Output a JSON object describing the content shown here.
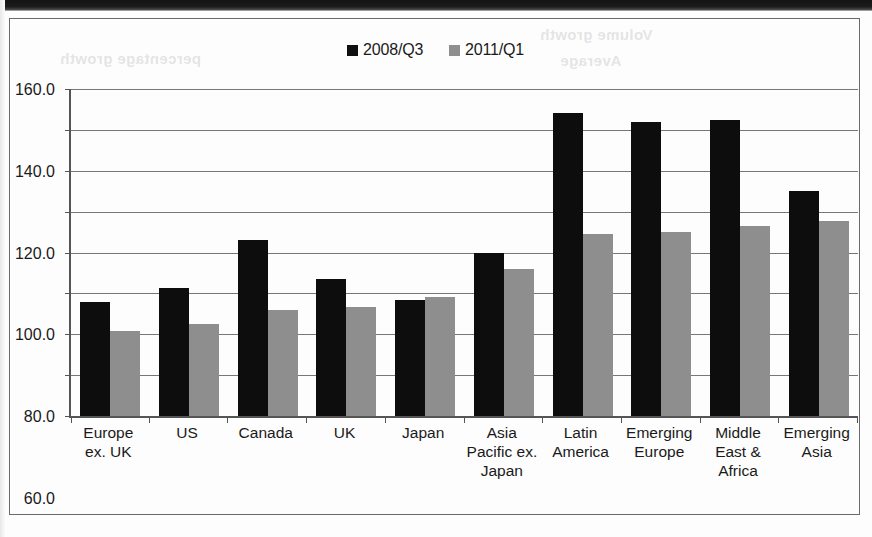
{
  "legend": {
    "entries": [
      {
        "label": "2008/Q3",
        "color": "#0d0d0d",
        "swatch": "black-square-icon"
      },
      {
        "label": "2011/Q1",
        "color": "#8e8e8e",
        "swatch": "gray-square-icon"
      }
    ]
  },
  "axis": {
    "y_ticks": [
      "160.0",
      "140.0",
      "120.0",
      "100.0",
      "80.0",
      "60.0",
      "40.0",
      "20.0",
      "0.0"
    ]
  },
  "chart_data": {
    "type": "bar",
    "title": "",
    "subtitle": "",
    "xlabel": "",
    "ylabel": "",
    "ylim": [
      0,
      160
    ],
    "ytick_step": 20,
    "grid": true,
    "legend_position": "top-center",
    "categories": [
      "Europe ex. UK",
      "US",
      "Canada",
      "UK",
      "Japan",
      "Asia Pacific ex. Japan",
      "Latin America",
      "Emerging Europe",
      "Middle East & Africa",
      "Emerging Asia"
    ],
    "category_lines": [
      [
        "Europe",
        "ex. UK"
      ],
      [
        "US"
      ],
      [
        "Canada"
      ],
      [
        "UK"
      ],
      [
        "Japan"
      ],
      [
        "Asia",
        "Pacific ex.",
        "Japan"
      ],
      [
        "Latin",
        "America"
      ],
      [
        "Emerging",
        "Europe"
      ],
      [
        "Middle",
        "East &",
        "Africa"
      ],
      [
        "Emerging",
        "Asia"
      ]
    ],
    "series": [
      {
        "name": "2008/Q3",
        "color": "#0d0d0d",
        "values": [
          56.0,
          62.5,
          86.0,
          67.0,
          57.0,
          80.0,
          148.5,
          144.0,
          145.0,
          110.0
        ]
      },
      {
        "name": "2011/Q1",
        "color": "#8e8e8e",
        "values": [
          41.5,
          45.0,
          52.0,
          53.5,
          58.0,
          72.0,
          89.0,
          90.0,
          93.0,
          95.5
        ]
      }
    ]
  },
  "ghost_text": {
    "line1": "Volume growth",
    "line2": "Average",
    "line3": "percentage growth"
  }
}
